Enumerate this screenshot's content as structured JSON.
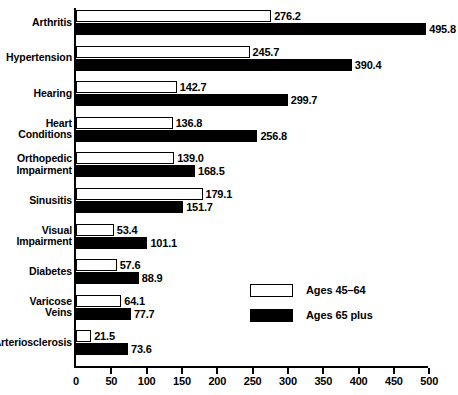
{
  "chart_data": {
    "type": "bar",
    "orientation": "horizontal",
    "title": "",
    "subtitle": "",
    "xlabel": "",
    "ylabel": "",
    "xlim": [
      0,
      500
    ],
    "grid": false,
    "legend_position": "center-right",
    "xticks": [
      0,
      50,
      100,
      150,
      200,
      250,
      300,
      350,
      400,
      450,
      500
    ],
    "xtick_labels": [
      "0",
      "50",
      "100",
      "150",
      "200",
      "250",
      "300",
      "350",
      "400",
      "450",
      "500"
    ],
    "categories": [
      "Arthritis",
      "Hypertension",
      "Hearing",
      "Heart\nConditions",
      "Orthopedic\nImpairment",
      "Sinusitis",
      "Visual\nImpairment",
      "Diabetes",
      "Varicose\nVeins",
      "Arteriosclerosis"
    ],
    "series": [
      {
        "name": "Ages 45–64",
        "style": "light",
        "values": [
          276.2,
          245.7,
          142.7,
          136.8,
          139.0,
          179.1,
          53.4,
          57.6,
          64.1,
          21.5
        ],
        "labels": [
          "276.2",
          "245.7",
          "142.7",
          "136.8",
          "139.0",
          "179.1",
          "53.4",
          "57.6",
          "64.1",
          "21.5"
        ]
      },
      {
        "name": "Ages 65 plus",
        "style": "dark",
        "values": [
          495.8,
          390.4,
          299.7,
          256.8,
          168.5,
          151.7,
          101.1,
          88.9,
          77.7,
          73.6
        ],
        "labels": [
          "495.8",
          "390.4",
          "299.7",
          "256.8",
          "168.5",
          "151.7",
          "101.1",
          "88.9",
          "77.7",
          "73.6"
        ]
      }
    ]
  },
  "legend": {
    "items": [
      {
        "label": "Ages 45–64",
        "style": "light"
      },
      {
        "label": "Ages 65 plus",
        "style": "dark"
      }
    ]
  },
  "colors": {
    "light_series": "#ffffff",
    "dark_series": "#000000",
    "axis": "#000000",
    "background": "#ffffff"
  }
}
